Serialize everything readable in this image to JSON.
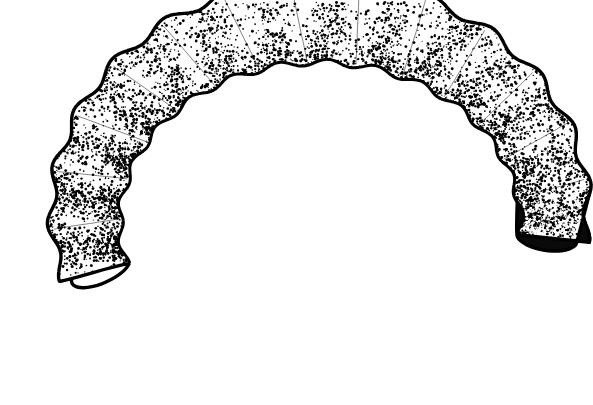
{
  "figure": {
    "domain_kind": "scientific-line-art",
    "subject": "scarabaeiform grub larva, lateral view, C-shaped",
    "technique": "pen-and-ink stipple",
    "caption": "",
    "label": "",
    "canvas": {
      "width": 593,
      "height": 405
    },
    "colors": {
      "background": "#ffffff",
      "ink": "#000000",
      "body_fill": "#ffffff",
      "terminal_shade": "#0a0a0a",
      "speckle": "#ffffff"
    },
    "stroke": {
      "outer_margin_width": 3.4,
      "inner_margin_width": 3.0,
      "groove_width": 0.9
    },
    "bounds": {
      "left": 44,
      "top": 31,
      "right": 552,
      "bottom": 374
    },
    "segment_count": 14,
    "body": {
      "outline_path": "M 330 31 C 382 31 432 38 476 55 C 512 69 539 90 549 116 C 557 137 556 163 548 191 C 540 219 524 240 505 244 C 487 248 472 238 465 221 C 459 206 462 190 470 176 C 458 190 441 196 424 192 C 410 189 401 180 397 169 C 392 182 379 191 364 191 C 350 191 339 184 334 173 C 329 185 317 193 303 193 C 289 193 278 186 273 175 C 268 187 256 195 242 195 C 228 195 217 188 212 177 C 207 189 195 197 181 196 C 171 196 162 192 156 185 C 152 195 146 205 139 214 C 131 224 124 235 119 247 C 113 262 112 277 116 291 C 120 306 129 318 141 327 C 150 334 161 339 172 342 C 183 345 194 347 205 351 C 216 355 226 361 233 369 C 239 375 248 377 256 374 C 265 371 271 363 272 354 C 273 342 268 331 259 324 C 251 318 241 315 232 310 C 243 315 256 315 266 310 C 275 306 281 298 283 289 C 286 297 293 304 302 306 C 313 309 324 305 331 297 C 336 291 338 283 337 276 C 340 284 347 290 355 292 C 365 294 375 290 381 283 C 387 276 389 266 386 257 C 383 247 375 240 366 237 C 356 234 346 236 339 242 C 333 247 329 254 328 262 C 328 252 325 241 318 233 C 310 223 297 218 285 221 C 274 224 266 232 263 242 C 260 231 252 221 241 216 C 228 210 212 212 202 222 C 193 230 189 241 190 252 C 186 241 178 232 167 228 C 155 223 141 226 132 234 C 122 243 118 256 121 268 C 117 257 109 248 98 244 C 87 240 74 242 65 249 C 55 257 50 269 52 281 C 49 270 42 260 32 255",
      "description": "C-shaped larval body arcing from the blunt head at lower-left, over the dorsal crest, down to the darkened terminal segment at right"
    },
    "segments": [
      {
        "id": 1,
        "name": "terminal-anal-segment",
        "angle_deg": 4,
        "shade": "solid-black",
        "stipple_density": 0.98,
        "position": "right-end"
      },
      {
        "id": 2,
        "name": "abdominal-segment-8",
        "angle_deg": 14,
        "shade": "heavy",
        "stipple_density": 0.72,
        "position": "right-arc"
      },
      {
        "id": 3,
        "name": "abdominal-segment-7",
        "angle_deg": 26,
        "shade": "heavy",
        "stipple_density": 0.68,
        "position": "right-arc"
      },
      {
        "id": 4,
        "name": "abdominal-segment-6",
        "angle_deg": 39,
        "shade": "medium",
        "stipple_density": 0.62,
        "position": "right-arc"
      },
      {
        "id": 5,
        "name": "abdominal-segment-5",
        "angle_deg": 52,
        "shade": "medium",
        "stipple_density": 0.6,
        "position": "dorsal-crest"
      },
      {
        "id": 6,
        "name": "abdominal-segment-4",
        "angle_deg": 65,
        "shade": "medium",
        "stipple_density": 0.58,
        "position": "dorsal-crest"
      },
      {
        "id": 7,
        "name": "abdominal-segment-3",
        "angle_deg": 78,
        "shade": "medium",
        "stipple_density": 0.58,
        "position": "dorsal-crest"
      },
      {
        "id": 8,
        "name": "abdominal-segment-2",
        "angle_deg": 91,
        "shade": "medium",
        "stipple_density": 0.6,
        "position": "dorsal-crest"
      },
      {
        "id": 9,
        "name": "abdominal-segment-1",
        "angle_deg": 104,
        "shade": "medium",
        "stipple_density": 0.62,
        "position": "dorsal-crest"
      },
      {
        "id": 10,
        "name": "metathorax",
        "angle_deg": 118,
        "shade": "heavy",
        "stipple_density": 0.7,
        "position": "left-shoulder"
      },
      {
        "id": 11,
        "name": "mesothorax",
        "angle_deg": 133,
        "shade": "heavy",
        "stipple_density": 0.76,
        "position": "left-bend"
      },
      {
        "id": 12,
        "name": "prothorax",
        "angle_deg": 150,
        "shade": "heavy",
        "stipple_density": 0.78,
        "position": "left-bend"
      },
      {
        "id": 13,
        "name": "neck-fold",
        "angle_deg": 168,
        "shade": "heavy",
        "stipple_density": 0.74,
        "position": "lower-left"
      },
      {
        "id": 14,
        "name": "head-capsule",
        "angle_deg": 188,
        "shade": "medium",
        "stipple_density": 0.64,
        "position": "head-end"
      }
    ],
    "anatomy_points": [
      {
        "name": "head-end",
        "x": 205,
        "y": 330,
        "note": "blunt rounded head capsule at lower-left"
      },
      {
        "name": "dorsal-crest",
        "x": 330,
        "y": 45,
        "note": "highest point of the arched back"
      },
      {
        "name": "terminal-segment",
        "x": 522,
        "y": 175,
        "note": "heavily inked anal segment at right"
      },
      {
        "name": "ventral-concavity",
        "x": 320,
        "y": 250,
        "note": "open interior of the C-curl"
      },
      {
        "name": "posterior-bend",
        "x": 120,
        "y": 250,
        "note": "tight flexure on the left side"
      }
    ],
    "stipple": {
      "seed": 20240617,
      "dot_count": 5200,
      "dot_radius_min": 0.55,
      "dot_radius_max": 1.5,
      "band_count": 14,
      "band_contrast": 0.82,
      "edge_darkening": 0.85
    },
    "terminal_speckle": {
      "count": 190,
      "radius_min": 0.5,
      "radius_max": 1.6
    }
  }
}
